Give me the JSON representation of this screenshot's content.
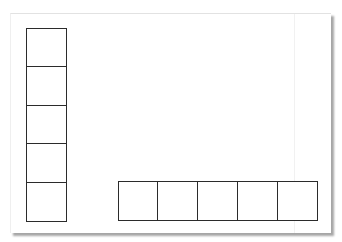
{
  "figure": {
    "top_fragment_text": "· ·                                   ·",
    "line_color": "#2b2b2b",
    "paper_color": "#ffffff",
    "shadow_color": "#808080"
  },
  "strips": [
    {
      "id": "vertical-strip",
      "orientation": "vertical",
      "cell_count": 5,
      "x": 15,
      "y": 14,
      "cell_width": 41,
      "cell_height": 38.8
    },
    {
      "id": "horizontal-strip",
      "orientation": "horizontal",
      "cell_count": 5,
      "x": 107,
      "y": 167,
      "cell_width": 40,
      "cell_height": 40
    }
  ]
}
